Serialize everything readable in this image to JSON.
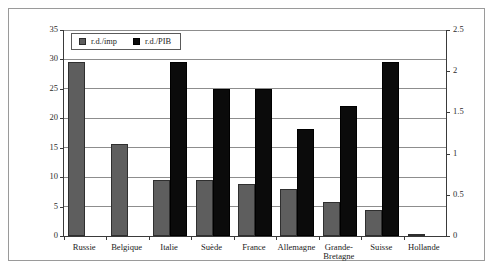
{
  "chart_data": {
    "type": "bar",
    "title": "",
    "subtitle": "",
    "xlabel": "",
    "ylabel": "",
    "grid": true,
    "legend_position": "top-left",
    "categories": [
      "Russie",
      "Belgique",
      "Italie",
      "Suède",
      "France",
      "Allemagne",
      "Grande-\nBretagne",
      "Suisse",
      "Hollande"
    ],
    "axes": {
      "left": {
        "label": "",
        "ylim": [
          0,
          35
        ],
        "ticks": [
          0,
          5,
          10,
          15,
          20,
          25,
          30,
          35
        ],
        "ticklabels": [
          "0",
          "5",
          "10",
          "15",
          "20",
          "25",
          "30",
          "35"
        ]
      },
      "right": {
        "label": "",
        "ylim": [
          0,
          2.5
        ],
        "ticks": [
          0,
          0.5,
          1,
          1.5,
          2,
          2.5
        ],
        "ticklabels": [
          "0",
          "0.5",
          "1",
          "1.5",
          "2",
          "2.5"
        ]
      }
    },
    "series": [
      {
        "name": "r.d./imp",
        "axis": "left",
        "color": "#5e5e5e",
        "values": [
          29.5,
          15.7,
          9.5,
          9.5,
          8.8,
          8.0,
          5.8,
          4.5,
          0.4
        ]
      },
      {
        "name": "r.d./PIB",
        "axis": "right",
        "color": "#0b0b0b",
        "values": [
          0,
          0,
          2.11,
          1.79,
          1.79,
          1.3,
          1.58,
          2.11,
          0
        ]
      }
    ]
  },
  "legend": {
    "items": [
      {
        "label": "r.d./imp",
        "swatch": "gray-square-icon"
      },
      {
        "label": "r.d./PIB",
        "swatch": "black-square-icon"
      }
    ]
  }
}
